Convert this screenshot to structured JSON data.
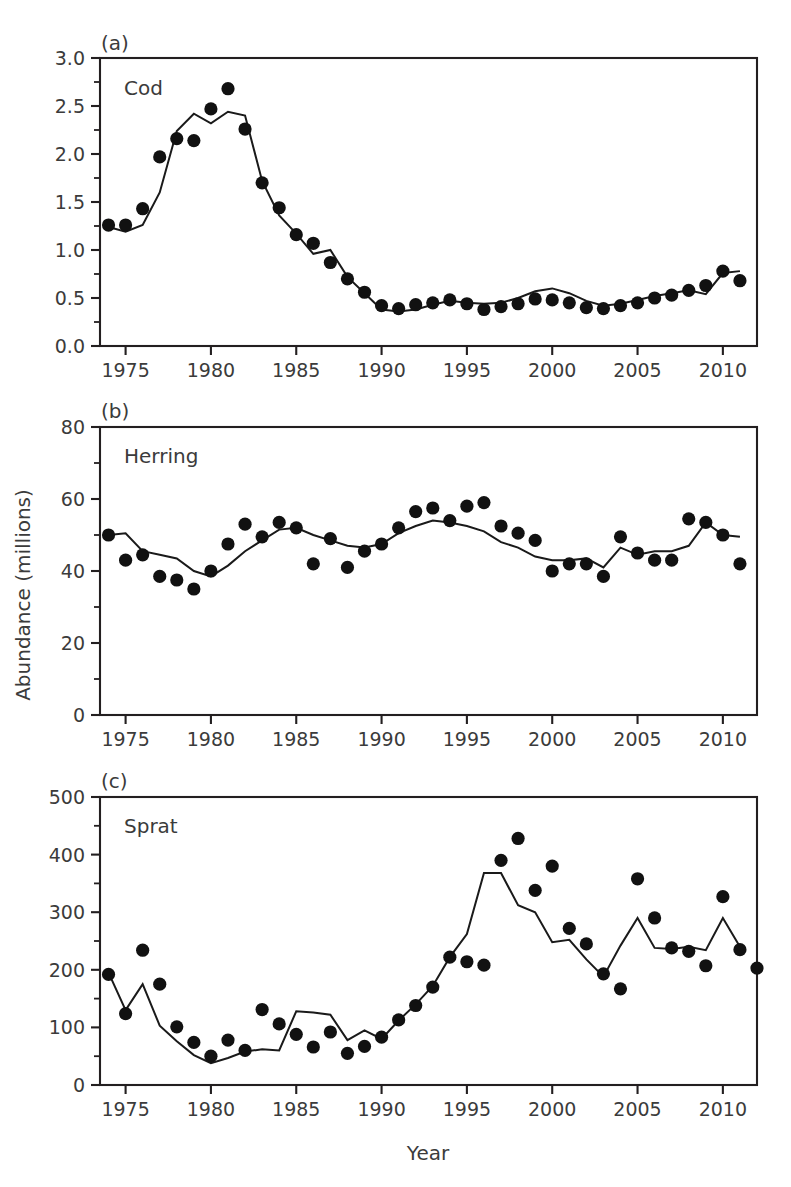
{
  "figure": {
    "axis_titles": {
      "x": "Year",
      "y": "Abundance  (millions)"
    },
    "x_tick_labels": [
      "1975",
      "1980",
      "1985",
      "1990",
      "1995",
      "2000",
      "2005",
      "2010"
    ],
    "x_tick_values": [
      1975,
      1980,
      1985,
      1990,
      1995,
      2000,
      2005,
      2010
    ],
    "x_range": [
      1973.5,
      2012.0
    ],
    "legend": {
      "observed": "filled circles",
      "model": "solid line"
    }
  },
  "chart_data": [
    {
      "type": "line",
      "panel_tag": "(a)",
      "title": "Cod",
      "xlabel": "",
      "ylabel": "",
      "ylim": [
        0.0,
        3.0
      ],
      "y_tick_labels": [
        "0.0",
        "0.5",
        "1.0",
        "1.5",
        "2.0",
        "2.5",
        "3.0"
      ],
      "y_tick_values": [
        0.0,
        0.5,
        1.0,
        1.5,
        2.0,
        2.5,
        3.0
      ],
      "x": [
        1974,
        1975,
        1976,
        1977,
        1978,
        1979,
        1980,
        1981,
        1982,
        1983,
        1984,
        1985,
        1986,
        1987,
        1988,
        1989,
        1990,
        1991,
        1992,
        1993,
        1994,
        1995,
        1996,
        1997,
        1998,
        1999,
        2000,
        2001,
        2002,
        2003,
        2004,
        2005,
        2006,
        2007,
        2008,
        2009,
        2010,
        2011
      ],
      "series": [
        {
          "name": "Observed",
          "style": "points",
          "values": [
            1.26,
            1.26,
            1.43,
            1.97,
            2.16,
            2.14,
            2.47,
            2.68,
            2.26,
            1.7,
            1.44,
            1.16,
            1.07,
            0.87,
            0.7,
            0.56,
            0.42,
            0.39,
            0.43,
            0.45,
            0.48,
            0.44,
            0.38,
            0.41,
            0.44,
            0.49,
            0.48,
            0.45,
            0.4,
            0.39,
            0.42,
            0.45,
            0.5,
            0.53,
            0.58,
            0.63,
            0.78,
            0.68
          ]
        },
        {
          "name": "Model",
          "style": "line",
          "values": [
            1.24,
            1.19,
            1.26,
            1.6,
            2.24,
            2.42,
            2.32,
            2.44,
            2.4,
            1.72,
            1.36,
            1.17,
            0.96,
            1.0,
            0.72,
            0.55,
            0.38,
            0.36,
            0.38,
            0.43,
            0.47,
            0.45,
            0.44,
            0.45,
            0.5,
            0.57,
            0.6,
            0.55,
            0.47,
            0.42,
            0.44,
            0.48,
            0.52,
            0.55,
            0.58,
            0.54,
            0.76,
            0.78
          ]
        }
      ]
    },
    {
      "type": "line",
      "panel_tag": "(b)",
      "title": "Herring",
      "xlabel": "",
      "ylabel": "",
      "ylim": [
        0,
        80
      ],
      "y_tick_labels": [
        "0",
        "20",
        "40",
        "60",
        "80"
      ],
      "y_tick_values": [
        0,
        20,
        40,
        60,
        80
      ],
      "x": [
        1974,
        1975,
        1976,
        1977,
        1978,
        1979,
        1980,
        1981,
        1982,
        1983,
        1984,
        1985,
        1986,
        1987,
        1988,
        1989,
        1990,
        1991,
        1992,
        1993,
        1994,
        1995,
        1996,
        1997,
        1998,
        1999,
        2000,
        2001,
        2002,
        2003,
        2004,
        2005,
        2006,
        2007,
        2008,
        2009,
        2010,
        2011
      ],
      "series": [
        {
          "name": "Observed",
          "style": "points",
          "values": [
            50.0,
            43.0,
            44.5,
            38.5,
            37.5,
            35.0,
            40.0,
            47.5,
            53.0,
            49.5,
            53.5,
            52.0,
            42.0,
            49.0,
            41.0,
            45.5,
            47.5,
            52.0,
            56.5,
            57.5,
            54.0,
            58.0,
            59.0,
            52.5,
            50.5,
            48.5,
            40.0,
            42.0,
            42.0,
            38.5,
            49.5,
            45.0,
            43.0,
            43.0,
            54.5,
            53.5,
            50.0,
            42.0
          ]
        },
        {
          "name": "Model",
          "style": "line",
          "values": [
            50.0,
            50.5,
            45.5,
            44.5,
            43.5,
            40.0,
            38.5,
            41.5,
            45.5,
            48.5,
            51.5,
            52.0,
            50.0,
            48.5,
            47.0,
            46.5,
            47.5,
            50.5,
            52.5,
            54.0,
            53.5,
            52.5,
            51.0,
            48.0,
            46.5,
            44.0,
            43.0,
            43.0,
            43.5,
            41.0,
            46.5,
            44.5,
            45.5,
            45.5,
            47.0,
            53.5,
            50.0,
            49.5
          ]
        }
      ]
    },
    {
      "type": "line",
      "panel_tag": "(c)",
      "title": "Sprat",
      "xlabel": "Year",
      "ylabel": "",
      "ylim": [
        0,
        500
      ],
      "y_tick_labels": [
        "0",
        "100",
        "200",
        "300",
        "400",
        "500"
      ],
      "y_tick_values": [
        0,
        100,
        200,
        300,
        400,
        500
      ],
      "x": [
        1974,
        1975,
        1976,
        1977,
        1978,
        1979,
        1980,
        1981,
        1982,
        1983,
        1984,
        1985,
        1986,
        1987,
        1988,
        1989,
        1990,
        1991,
        1992,
        1993,
        1994,
        1995,
        1996,
        1997,
        1998,
        1999,
        2000,
        2001,
        2002,
        2003,
        2004,
        2005,
        2006,
        2007,
        2008,
        2009,
        2010,
        2011
      ],
      "series": [
        {
          "name": "Observed",
          "style": "points",
          "values": [
            192,
            124,
            234,
            175,
            101,
            74,
            50,
            78,
            60,
            131,
            106,
            88,
            66,
            92,
            55,
            67,
            83,
            113,
            138,
            170,
            222,
            214,
            208,
            390,
            428,
            338,
            380,
            272,
            245,
            193,
            167,
            358,
            290,
            238,
            232,
            207,
            327,
            235,
            203
          ]
        },
        {
          "name": "Model",
          "style": "line",
          "values": [
            195,
            130,
            175,
            103,
            76,
            52,
            38,
            47,
            58,
            62,
            60,
            128,
            126,
            122,
            78,
            95,
            80,
            112,
            140,
            172,
            222,
            262,
            368,
            368,
            312,
            300,
            248,
            252,
            218,
            188,
            242,
            290,
            238,
            236,
            240,
            234,
            290,
            240
          ]
        }
      ]
    }
  ]
}
